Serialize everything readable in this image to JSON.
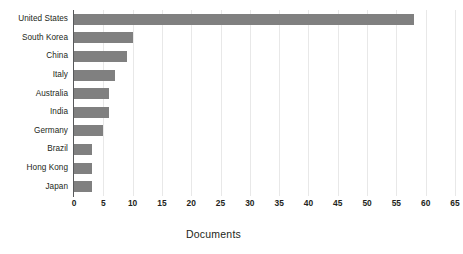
{
  "chart_data": {
    "type": "bar",
    "orientation": "horizontal",
    "title": "",
    "xlabel": "Documents",
    "ylabel": "",
    "categories": [
      "United States",
      "South Korea",
      "China",
      "Italy",
      "Australia",
      "India",
      "Germany",
      "Brazil",
      "Hong Kong",
      "Japan"
    ],
    "values": [
      58,
      10,
      9,
      7,
      6,
      6,
      5,
      3,
      3,
      3
    ],
    "series": [
      {
        "name": "Documents",
        "values": [
          58,
          10,
          9,
          7,
          6,
          6,
          5,
          3,
          3,
          3
        ]
      }
    ],
    "xlim": [
      0,
      65
    ],
    "xticks": [
      0,
      5,
      10,
      15,
      20,
      25,
      30,
      35,
      40,
      45,
      50,
      55,
      60,
      65
    ],
    "xtick_labels": [
      "0",
      "5",
      "10",
      "15",
      "20",
      "25",
      "30",
      "35",
      "40",
      "45",
      "50",
      "55",
      "60",
      "65"
    ],
    "grid": true,
    "grid_axis": "x",
    "legend": false,
    "bar_color": "#808080",
    "grid_color": "#e8e8e8",
    "axis_color": "#58595b",
    "text_color": "#231f20",
    "background": "#ffffff"
  }
}
